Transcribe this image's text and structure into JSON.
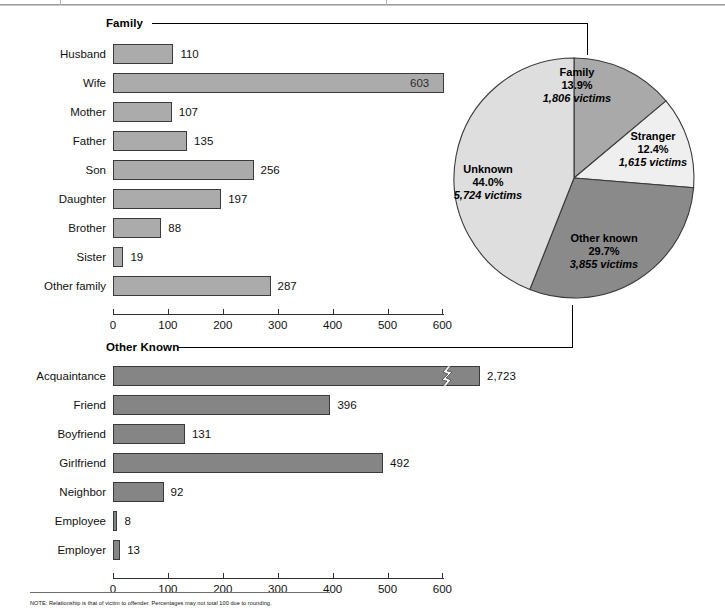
{
  "chart_data": [
    {
      "type": "pie",
      "title": "Victim-offender relationship",
      "legend_position": "inside-slices",
      "slices": [
        {
          "label": "Family",
          "percent": 13.9,
          "victims": 1806,
          "percent_text": "13.9%",
          "victims_text": "1,806 victims",
          "color": "#a9a9a9"
        },
        {
          "label": "Stranger",
          "percent": 12.4,
          "victims": 1615,
          "percent_text": "12.4%",
          "victims_text": "1,615 victims",
          "color": "#efefef"
        },
        {
          "label": "Other known",
          "percent": 29.7,
          "victims": 3855,
          "percent_text": "29.7%",
          "victims_text": "3,855 victims",
          "color": "#8a8a8a"
        },
        {
          "label": "Unknown",
          "percent": 44.0,
          "victims": 5724,
          "percent_text": "44.0%",
          "victims_text": "5,724 victims",
          "color": "#dedede"
        }
      ]
    },
    {
      "type": "bar",
      "orientation": "horizontal",
      "title": "Family",
      "xlabel": "",
      "ylabel": "",
      "xlim": [
        0,
        640
      ],
      "grid": false,
      "bar_color": "#ababab",
      "ticks": [
        0,
        100,
        200,
        300,
        400,
        500,
        600
      ],
      "categories": [
        "Husband",
        "Wife",
        "Mother",
        "Father",
        "Son",
        "Daughter",
        "Brother",
        "Sister",
        "Other family"
      ],
      "values": [
        110,
        603,
        107,
        135,
        256,
        197,
        88,
        19,
        287
      ],
      "value_labels": [
        "110",
        "603",
        "107",
        "135",
        "256",
        "197",
        "88",
        "19",
        "287"
      ]
    },
    {
      "type": "bar",
      "orientation": "horizontal",
      "title": "Other Known",
      "xlabel": "",
      "ylabel": "",
      "xlim": [
        0,
        640
      ],
      "grid": false,
      "bar_color": "#858585",
      "ticks": [
        0,
        100,
        200,
        300,
        400,
        500,
        600
      ],
      "categories": [
        "Acquaintance",
        "Friend",
        "Boyfriend",
        "Girlfriend",
        "Neighbor",
        "Employee",
        "Employer"
      ],
      "values": [
        2723,
        396,
        131,
        492,
        92,
        8,
        13
      ],
      "value_labels": [
        "2,723",
        "396",
        "131",
        "492",
        "92",
        "8",
        "13"
      ],
      "broken_axis_bars": [
        "Acquaintance"
      ]
    }
  ],
  "headers": {
    "family": "Family",
    "other_known": "Other Known"
  },
  "axis": {
    "tick_labels": [
      "0",
      "100",
      "200",
      "300",
      "400",
      "500",
      "600"
    ]
  },
  "footer": {
    "note": "NOTE: Relationship is that of victim to offender. Percentages may not total 100 due to rounding."
  }
}
